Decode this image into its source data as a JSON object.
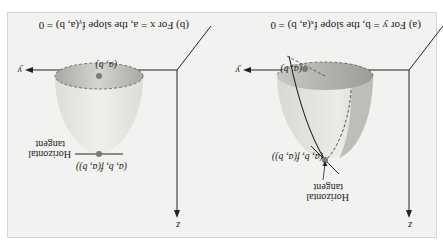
{
  "figure": {
    "panels": [
      {
        "id": "a",
        "caption": "(a) For y = b, the slope fₓ(a, b) = 0",
        "labels": {
          "z_axis": "z",
          "y_axis": "y",
          "x_axis": "x",
          "point_top": "(a, b, f(a, b))",
          "point_bottom": "(a, b)",
          "tangent_line1": "Horizontal",
          "tangent_line2": "tangent"
        }
      },
      {
        "id": "b",
        "caption": "(b) For x = a, the slope fᵧ(a, b) = 0",
        "labels": {
          "z_axis": "z",
          "y_axis": "y",
          "x_axis": "x",
          "point_top": "(a, b, f(a, b))",
          "point_bottom": "(a, b)",
          "tangent_line1": "Horizontal",
          "tangent_line2": "tangent"
        }
      }
    ]
  },
  "colors": {
    "surface_light": "#e6e6e2",
    "surface_dark": "#b4b4b0",
    "point": "#7a7a7a",
    "axis": "#222222",
    "frame_bg": "#f2f2f0"
  }
}
